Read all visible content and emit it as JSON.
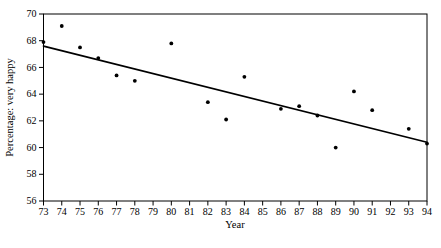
{
  "page": {
    "background": "#ffffff",
    "foreground": "#000000"
  },
  "chart_data": {
    "type": "scatter",
    "xlabel": "Year",
    "ylabel": "Percentage: very happy",
    "x": [
      73,
      74,
      75,
      76,
      77,
      78,
      80,
      82,
      83,
      84,
      86,
      87,
      88,
      89,
      90,
      91,
      93,
      94
    ],
    "y": [
      67.9,
      69.1,
      67.5,
      66.7,
      65.4,
      65.0,
      67.8,
      63.4,
      62.1,
      65.3,
      62.9,
      63.1,
      62.4,
      60.0,
      64.2,
      62.8,
      61.4,
      60.3
    ],
    "xlim": [
      73,
      94
    ],
    "ylim": [
      56,
      70
    ],
    "x_ticks": [
      73,
      74,
      75,
      76,
      77,
      78,
      79,
      80,
      81,
      82,
      83,
      84,
      85,
      86,
      87,
      88,
      89,
      90,
      91,
      92,
      93,
      94
    ],
    "y_ticks": [
      56,
      58,
      60,
      62,
      64,
      66,
      68,
      70
    ],
    "trendline": {
      "x1": 73,
      "y1": 67.6,
      "x2": 94,
      "y2": 60.4
    },
    "grid": false,
    "legend": "none",
    "point_color": "#000000",
    "line_color": "#000000",
    "frame_color": "#000000"
  }
}
